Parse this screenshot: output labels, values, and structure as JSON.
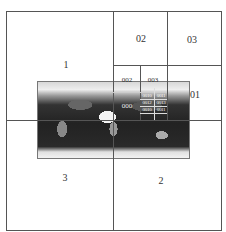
{
  "diagram": {
    "caption_cropped": "",
    "level1": {
      "q1": "1",
      "q2": "2",
      "q3": "3"
    },
    "level2": {
      "q01": "01",
      "q02": "02",
      "q03": "03"
    },
    "level3": {
      "q002": "002",
      "q003": "003",
      "q000": "000"
    },
    "level4": [
      "0010",
      "0011",
      "0012",
      "0013",
      "0010",
      "0011"
    ],
    "map_description": "world map (grayscale)"
  }
}
